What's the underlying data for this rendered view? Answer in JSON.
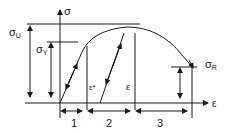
{
  "diagram": {
    "type": "stress-strain curve",
    "axes": {
      "y_label": "σ",
      "x_label": "ε"
    },
    "levels": {
      "ultimate": {
        "symbol": "σ",
        "sub": "U"
      },
      "yield": {
        "symbol": "σ",
        "sub": "Y"
      },
      "rupture": {
        "symbol": "σ",
        "sub": "R"
      }
    },
    "strain_labels": {
      "plastic": "ε*",
      "total": "ε"
    },
    "regions": [
      {
        "label": "1"
      },
      {
        "label": "2"
      },
      {
        "label": "3"
      }
    ],
    "colors": {
      "line": "#1a1a1a",
      "background": "#ffffff"
    }
  }
}
